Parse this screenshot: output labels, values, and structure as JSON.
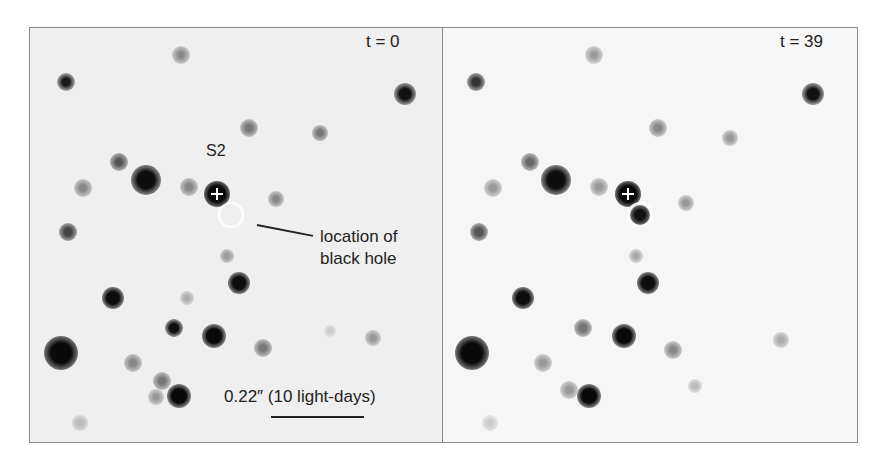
{
  "figure": {
    "panels": [
      {
        "id": "left",
        "time_label": "t = 0",
        "star_label": "S2",
        "annotation_line1": "location of",
        "annotation_line2": "black hole",
        "scale_label": "0.22″ (10 light-days)"
      },
      {
        "id": "right",
        "time_label": "t = 39"
      }
    ],
    "colors": {
      "background": "#efefef",
      "star": "#111111",
      "marker": "#ffffff",
      "text": "#222222",
      "border": "#8a8a8a"
    }
  }
}
